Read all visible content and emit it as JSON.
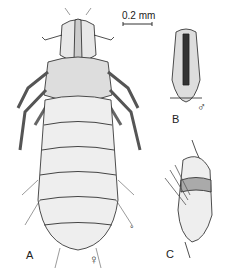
{
  "figure": {
    "scale_bar": {
      "label": "0.2 mm"
    },
    "panels": [
      {
        "id": "A",
        "label": "A",
        "sex_symbol": "♀",
        "description": "louse, ventral view"
      },
      {
        "id": "B",
        "label": "B",
        "sex_symbol": "♂",
        "description": "male genitalia"
      },
      {
        "id": "C",
        "label": "C",
        "description": "egg (nit) attached to hair"
      }
    ],
    "small_mark": "°"
  }
}
